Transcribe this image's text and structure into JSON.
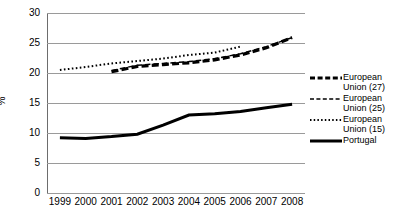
{
  "chart_data": {
    "type": "line",
    "title": "",
    "xlabel": "",
    "ylabel": "%",
    "x": [
      1999,
      2000,
      2001,
      2002,
      2003,
      2004,
      2005,
      2006,
      2007,
      2008
    ],
    "xtick_labels": [
      "1999",
      "2000",
      "2001",
      "2002",
      "2003",
      "2004",
      "2005",
      "2006",
      "2007",
      "2008"
    ],
    "ytick_labels": [
      "0",
      "5",
      "10",
      "15",
      "20",
      "25",
      "30"
    ],
    "yticks": [
      0,
      5,
      10,
      15,
      20,
      25,
      30
    ],
    "ylim": [
      0,
      30
    ],
    "grid": "horizontal",
    "legend_position": "right",
    "series": [
      {
        "name": "European Union (27)",
        "label_lines": "European\nUnion (27)",
        "style": "thick-dashed",
        "color": "#000000",
        "x": [
          2001,
          2002,
          2003,
          2004,
          2005,
          2006,
          2007,
          2008
        ],
        "values": [
          20.2,
          21.1,
          21.4,
          21.7,
          22.2,
          23.0,
          24.2,
          25.9
        ]
      },
      {
        "name": "European Union (25)",
        "label_lines": "European\nUnion (25)",
        "style": "thin-dashed",
        "color": "#000000",
        "x": [
          2001,
          2002,
          2003,
          2004,
          2005,
          2006,
          2007,
          2008
        ],
        "values": [
          20.4,
          21.3,
          21.6,
          21.9,
          22.4,
          23.2,
          24.4,
          25.9
        ]
      },
      {
        "name": "European Union (15)",
        "label_lines": "European\nUnion (15)",
        "style": "dotted",
        "color": "#000000",
        "x": [
          1999,
          2000,
          2001,
          2002,
          2003,
          2004,
          2005,
          2006
        ],
        "values": [
          20.5,
          21.0,
          21.6,
          22.0,
          22.4,
          23.0,
          23.4,
          24.4
        ]
      },
      {
        "name": "Portugal",
        "label_lines": "Portugal",
        "style": "thick-solid",
        "color": "#000000",
        "x": [
          1999,
          2000,
          2001,
          2002,
          2003,
          2004,
          2005,
          2006,
          2007,
          2008
        ],
        "values": [
          9.2,
          9.1,
          9.4,
          9.8,
          11.3,
          13.0,
          13.2,
          13.6,
          14.2,
          14.8
        ]
      }
    ]
  },
  "legend": {
    "items": [
      {
        "label": "European\nUnion (27)",
        "swatch": "thick-dashed-line-icon"
      },
      {
        "label": "European\nUnion (25)",
        "swatch": "thin-dashed-line-icon"
      },
      {
        "label": "European\nUnion (15)",
        "swatch": "dotted-line-icon"
      },
      {
        "label": "Portugal",
        "swatch": "thick-solid-line-icon"
      }
    ]
  },
  "colors": {
    "ink": "#000000",
    "gridline": "#9a9a9a",
    "axis": "#6d6d6d",
    "background": "#ffffff"
  }
}
